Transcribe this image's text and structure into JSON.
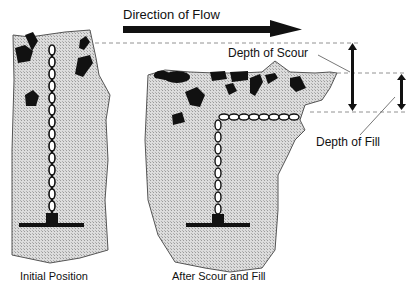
{
  "labels": {
    "flow": "Direction of Flow",
    "scour": "Depth of Scour",
    "fill": "Depth of Fill",
    "initial": "Initial Position",
    "after": "After Scour and Fill"
  },
  "colors": {
    "sediment": "#d4d4d4",
    "ink": "#111111"
  }
}
